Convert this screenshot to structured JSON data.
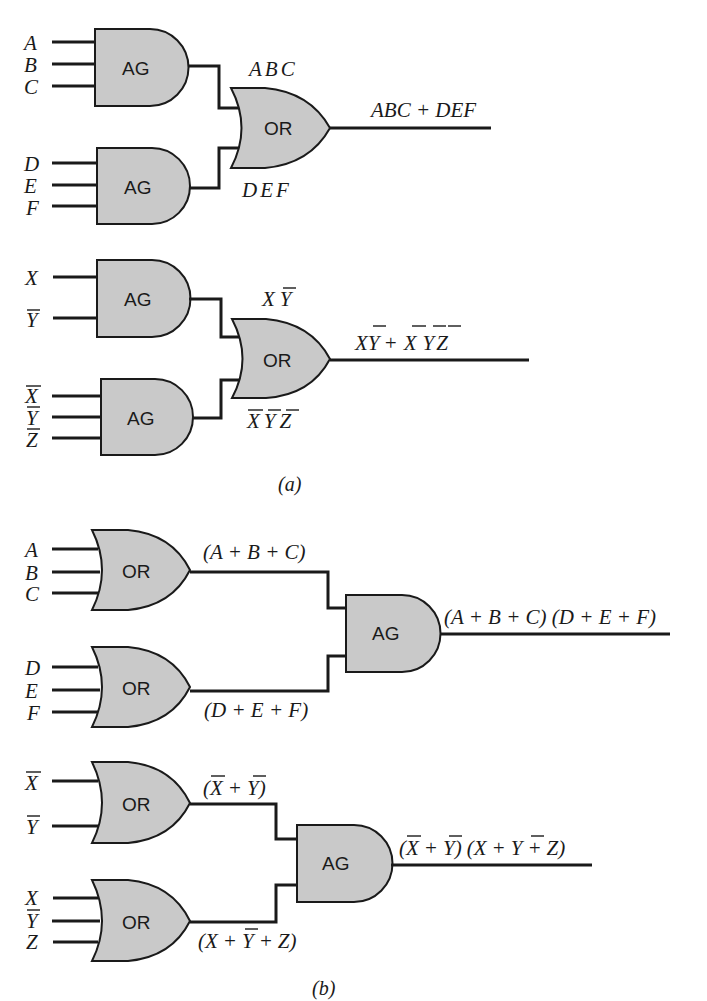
{
  "figure": {
    "part_a": {
      "caption": "(a)",
      "circuit1": {
        "inputs_gate1": [
          "A",
          "B",
          "C"
        ],
        "inputs_gate2": [
          "D",
          "E",
          "F"
        ],
        "gate1_label": "AG",
        "gate2_label": "AG",
        "combiner_label": "OR",
        "term1": "ABC",
        "term2": "DEF",
        "output": "ABC + DEF"
      },
      "circuit2": {
        "inputs_gate1": [
          "X",
          "Y"
        ],
        "inputs_gate2": [
          "X",
          "Y",
          "Z"
        ],
        "gate1_label": "AG",
        "gate2_label": "AG",
        "combiner_label": "OR",
        "term1": "XY",
        "term2": "XYZ",
        "output": "XY + XYZ",
        "notation": {
          "inputs_gate1": "X, Y-bar",
          "inputs_gate2": "X-bar, Y-bar, Z-bar",
          "term1": "X Y-bar",
          "term2": "X-bar Y-bar Z-bar",
          "output": "X Y-bar + X-bar Y-bar Z-bar"
        }
      }
    },
    "part_b": {
      "caption": "(b)",
      "circuit1": {
        "inputs_gate1": [
          "A",
          "B",
          "C"
        ],
        "inputs_gate2": [
          "D",
          "E",
          "F"
        ],
        "gate1_label": "OR",
        "gate2_label": "OR",
        "combiner_label": "AG",
        "term1": "(A + B + C)",
        "term2": "(D + E + F)",
        "output": "(A + B + C) (D + E + F)"
      },
      "circuit2": {
        "inputs_gate1": [
          "X",
          "Y"
        ],
        "inputs_gate2": [
          "X",
          "Y",
          "Z"
        ],
        "gate1_label": "OR",
        "gate2_label": "OR",
        "combiner_label": "AG",
        "term1": "(X + Y)",
        "term2": "(X + Y + Z)",
        "output": "(X + Y) (X + Y + Z)",
        "notation": {
          "inputs_gate1": "X-bar, Y-bar",
          "inputs_gate2": "X, Y-bar, Z",
          "term1": "(X-bar + Y-bar)",
          "term2": "(X + Y-bar + Z)",
          "output": "(X-bar + Y-bar) (X + Y-bar + Z)"
        }
      }
    },
    "colors": {
      "gate_fill": "#c9c9c9",
      "stroke": "#1a1a1a",
      "background": "#ffffff"
    }
  }
}
